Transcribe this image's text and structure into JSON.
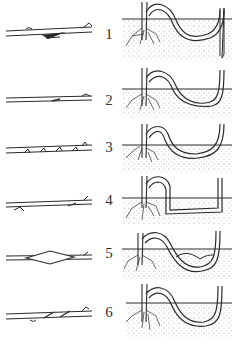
{
  "figure": {
    "type": "layering-methods-illustration",
    "colors": {
      "ink": "#2a2a2a",
      "soil_dots": "#8a8a8a",
      "background": "#ffffff"
    },
    "rows": [
      {
        "label": "1",
        "cutting_style": "tongue-cut",
        "top": 0,
        "ground_y": 19,
        "cutting_y": 29
      },
      {
        "label": "2",
        "cutting_style": "slight-notch",
        "top": 62,
        "ground_y": 27,
        "cutting_y": 38
      },
      {
        "label": "3",
        "cutting_style": "multiple-notches",
        "top": 118,
        "ground_y": 27,
        "cutting_y": 30
      },
      {
        "label": "4",
        "cutting_style": "split-twist",
        "top": 172,
        "ground_y": 26,
        "cutting_y": 32
      },
      {
        "label": "5",
        "cutting_style": "ring-bark-slit",
        "top": 225,
        "ground_y": 24,
        "cutting_y": 31
      },
      {
        "label": "6",
        "cutting_style": "spiral-wound",
        "top": 282,
        "ground_y": 21,
        "cutting_y": 30
      }
    ]
  }
}
